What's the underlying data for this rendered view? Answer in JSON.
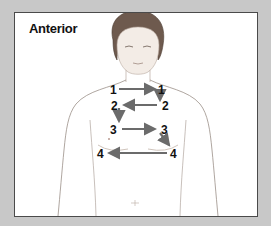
{
  "diagram": {
    "title": "Anterior",
    "arrow_color": "#6b6b6b",
    "points": [
      {
        "label": "1",
        "side": "right",
        "x": 113,
        "y": 89
      },
      {
        "label": "1",
        "side": "left",
        "x": 161,
        "y": 89
      },
      {
        "label": "2",
        "side": "left",
        "x": 163,
        "y": 105
      },
      {
        "label": "2",
        "side": "right",
        "x": 114,
        "y": 105
      },
      {
        "label": "3",
        "side": "right",
        "x": 112,
        "y": 128
      },
      {
        "label": "3",
        "side": "left",
        "x": 163,
        "y": 128
      },
      {
        "label": "4",
        "side": "left",
        "x": 173,
        "y": 152
      },
      {
        "label": "4",
        "side": "right",
        "x": 98,
        "y": 152
      }
    ],
    "sequence": [
      "1 → 1",
      "1 ↓ 2",
      "2 ← 2",
      "2 ↓ 3",
      "3 → 3",
      "3 ↘ 4",
      "4 ← 4"
    ]
  }
}
